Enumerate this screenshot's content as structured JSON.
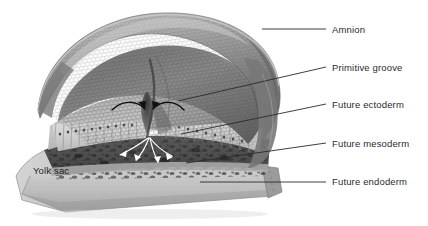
{
  "figure": {
    "background_color": "#ffffff",
    "width": 428,
    "height": 226
  },
  "callouts": [
    {
      "id": "amnion",
      "label": "Amnion",
      "text_x": 332,
      "text_y": 25,
      "leader": {
        "x1": 262,
        "y1": 29,
        "x2": 326,
        "y2": 29,
        "curved": false
      }
    },
    {
      "id": "primitive-groove",
      "label": "Primitive groove",
      "text_x": 332,
      "text_y": 63,
      "leader": {
        "x1": 178,
        "y1": 101,
        "x2": 326,
        "y2": 67,
        "curved": false
      }
    },
    {
      "id": "future-ectoderm",
      "label": "Future ectoderm",
      "text_x": 332,
      "text_y": 100,
      "leader": {
        "x1": 181,
        "y1": 134,
        "x2": 326,
        "y2": 104,
        "curved": false
      }
    },
    {
      "id": "future-mesoderm",
      "label": "Future mesoderm",
      "text_x": 332,
      "text_y": 139,
      "leader": {
        "x1": 186,
        "y1": 163,
        "x2": 326,
        "y2": 143,
        "curved": false
      }
    },
    {
      "id": "future-endoderm",
      "label": "Future endoderm",
      "text_x": 332,
      "text_y": 176,
      "leader": {
        "x1": 200,
        "y1": 182,
        "x2": 326,
        "y2": 182,
        "curved": false
      }
    }
  ],
  "inner_labels": [
    {
      "id": "yolk-sac",
      "label": "Yolk sac",
      "text_x": 33,
      "text_y": 166
    }
  ],
  "structures": [
    {
      "id": "amnion-dome",
      "name": "amnion dome",
      "tone": "#8d8d8d"
    },
    {
      "id": "amnion-rim",
      "name": "amnion cut rim",
      "tone": "#6f6f6f"
    },
    {
      "id": "epiblast-sheet",
      "name": "epiblast / future ectoderm sheet",
      "tone": "#b9b9b9"
    },
    {
      "id": "columnar-cells",
      "name": "columnar epiblast cell row",
      "tone": "#cfcfcf"
    },
    {
      "id": "mesoderm-layer",
      "name": "migrating mesoderm cell layer",
      "tone": "#5a5a5a"
    },
    {
      "id": "endoderm-layer",
      "name": "endoderm floor / yolk sac roof",
      "tone": "#a8a8a8"
    },
    {
      "id": "yolk-sac-block",
      "name": "yolk sac block",
      "tone": "#bdbdbd"
    }
  ],
  "arrows": {
    "ingression_top": {
      "name": "converging epiblast ingression arrows",
      "color": "#111111",
      "count": 2
    },
    "ingression_bottom": {
      "name": "splaying mesoderm migration arrows",
      "color": "#ffffff",
      "count": 3
    }
  },
  "colors": {
    "leader_line": "#2a2a2a",
    "label_text": "#2b2b2b",
    "inner_label_text": "#1e1e1e",
    "background": "#ffffff"
  }
}
